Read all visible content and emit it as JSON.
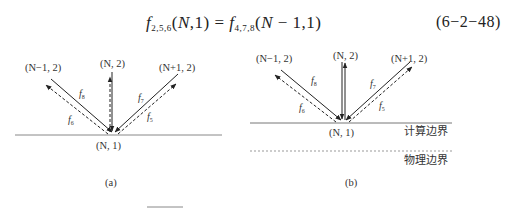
{
  "equation": {
    "lhs_func": "f",
    "lhs_sub": "2,5,6",
    "lhs_args_open": "(",
    "lhs_var": "N",
    "lhs_rest": ",1) = ",
    "rhs_func": "f",
    "rhs_sub": "4,7,8",
    "rhs_args_open": "(",
    "rhs_var": "N",
    "rhs_rest": " − 1,1)",
    "number": "(6−2−48)"
  },
  "figure_a": {
    "caption": "(a)",
    "node_left": "(N−1, 2)",
    "node_center": "(N, 2)",
    "node_right": "(N+1, 2)",
    "node_origin": "(N, 1)",
    "f8": {
      "base": "f",
      "sub": "8"
    },
    "f6": {
      "base": "f",
      "sub": "6"
    },
    "f7": {
      "base": "f",
      "sub": "7"
    },
    "f5": {
      "base": "f",
      "sub": "5"
    }
  },
  "figure_b": {
    "caption": "(b)",
    "node_left": "(N−1, 2)",
    "node_center": "(N, 2)",
    "node_right": "(N+1, 2)",
    "node_origin": "(N, 1)",
    "f8": {
      "base": "f",
      "sub": "8"
    },
    "f6": {
      "base": "f",
      "sub": "6"
    },
    "f7": {
      "base": "f",
      "sub": "7"
    },
    "f5": {
      "base": "f",
      "sub": "5"
    },
    "computational_boundary_label": "计算边界",
    "physical_boundary_label": "物理边界"
  },
  "colors": {
    "line": "#333333",
    "boundary": "#888888",
    "dashed_boundary": "#999999"
  }
}
